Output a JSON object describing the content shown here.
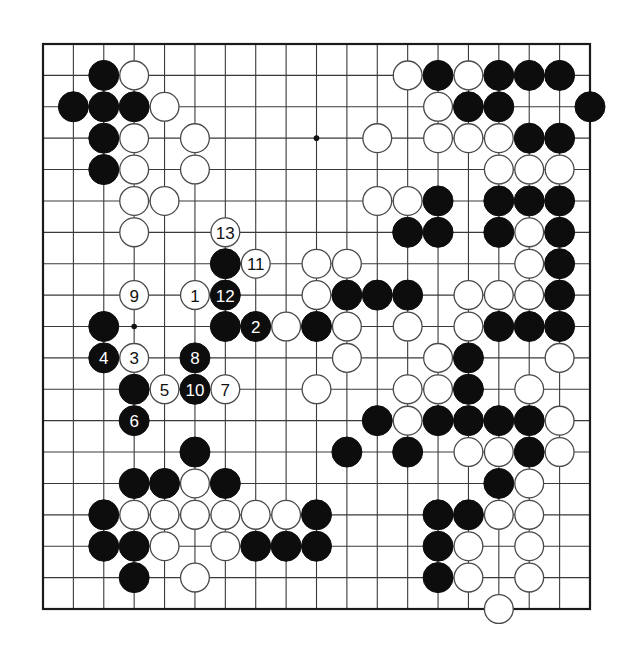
{
  "diagram": {
    "type": "go-board",
    "board_size": 19,
    "layout": {
      "left": 43,
      "top": 44,
      "right": 590,
      "bottom": 609,
      "stone_radius": 15
    },
    "colors": {
      "background": "#ffffff",
      "black": "#0d0d0d",
      "white": "#ffffff",
      "line": "#3a3a3a"
    },
    "star_points": [
      [
        9,
        3
      ],
      [
        3,
        9
      ]
    ],
    "stones": {
      "black": [
        [
          2,
          1
        ],
        [
          13,
          1
        ],
        [
          15,
          1
        ],
        [
          16,
          1
        ],
        [
          17,
          1
        ],
        [
          1,
          2
        ],
        [
          2,
          2
        ],
        [
          3,
          2
        ],
        [
          14,
          2
        ],
        [
          15,
          2
        ],
        [
          18,
          2
        ],
        [
          2,
          3
        ],
        [
          16,
          3
        ],
        [
          17,
          3
        ],
        [
          2,
          4
        ],
        [
          13,
          5
        ],
        [
          15,
          5
        ],
        [
          16,
          5
        ],
        [
          17,
          5
        ],
        [
          12,
          6
        ],
        [
          13,
          6
        ],
        [
          15,
          6
        ],
        [
          17,
          6
        ],
        [
          6,
          7
        ],
        [
          17,
          7
        ],
        [
          10,
          8
        ],
        [
          11,
          8
        ],
        [
          12,
          8
        ],
        [
          17,
          8
        ],
        [
          2,
          9
        ],
        [
          6,
          9
        ],
        [
          9,
          9
        ],
        [
          15,
          9
        ],
        [
          16,
          9
        ],
        [
          17,
          9
        ],
        [
          14,
          10
        ],
        [
          3,
          11
        ],
        [
          14,
          11
        ],
        [
          11,
          12
        ],
        [
          13,
          12
        ],
        [
          14,
          12
        ],
        [
          15,
          12
        ],
        [
          16,
          12
        ],
        [
          5,
          13
        ],
        [
          10,
          13
        ],
        [
          12,
          13
        ],
        [
          16,
          13
        ],
        [
          3,
          14
        ],
        [
          4,
          14
        ],
        [
          6,
          14
        ],
        [
          15,
          14
        ],
        [
          2,
          15
        ],
        [
          9,
          15
        ],
        [
          13,
          15
        ],
        [
          14,
          15
        ],
        [
          2,
          16
        ],
        [
          3,
          16
        ],
        [
          7,
          16
        ],
        [
          8,
          16
        ],
        [
          9,
          16
        ],
        [
          13,
          16
        ],
        [
          3,
          17
        ],
        [
          13,
          17
        ]
      ],
      "white": [
        [
          3,
          1
        ],
        [
          12,
          1
        ],
        [
          14,
          1
        ],
        [
          4,
          2
        ],
        [
          13,
          2
        ],
        [
          3,
          3
        ],
        [
          5,
          3
        ],
        [
          11,
          3
        ],
        [
          13,
          3
        ],
        [
          14,
          3
        ],
        [
          15,
          3
        ],
        [
          3,
          4
        ],
        [
          5,
          4
        ],
        [
          15,
          4
        ],
        [
          16,
          4
        ],
        [
          17,
          4
        ],
        [
          3,
          5
        ],
        [
          4,
          5
        ],
        [
          11,
          5
        ],
        [
          12,
          5
        ],
        [
          3,
          6
        ],
        [
          16,
          6
        ],
        [
          9,
          7
        ],
        [
          10,
          7
        ],
        [
          16,
          7
        ],
        [
          9,
          8
        ],
        [
          14,
          8
        ],
        [
          15,
          8
        ],
        [
          16,
          8
        ],
        [
          8,
          9
        ],
        [
          10,
          9
        ],
        [
          12,
          9
        ],
        [
          14,
          9
        ],
        [
          10,
          10
        ],
        [
          13,
          10
        ],
        [
          17,
          10
        ],
        [
          9,
          11
        ],
        [
          12,
          11
        ],
        [
          13,
          11
        ],
        [
          16,
          11
        ],
        [
          12,
          12
        ],
        [
          17,
          12
        ],
        [
          14,
          13
        ],
        [
          15,
          13
        ],
        [
          17,
          13
        ],
        [
          5,
          14
        ],
        [
          16,
          14
        ],
        [
          3,
          15
        ],
        [
          4,
          15
        ],
        [
          5,
          15
        ],
        [
          6,
          15
        ],
        [
          7,
          15
        ],
        [
          8,
          15
        ],
        [
          15,
          15
        ],
        [
          16,
          15
        ],
        [
          4,
          16
        ],
        [
          6,
          16
        ],
        [
          14,
          16
        ],
        [
          16,
          16
        ],
        [
          5,
          17
        ],
        [
          14,
          17
        ],
        [
          16,
          17
        ],
        [
          15,
          18
        ]
      ]
    },
    "numbered_moves": [
      {
        "n": "1",
        "color": "white",
        "col": 5,
        "row": 8
      },
      {
        "n": "2",
        "color": "black",
        "col": 7,
        "row": 9
      },
      {
        "n": "3",
        "color": "white",
        "col": 3,
        "row": 10
      },
      {
        "n": "4",
        "color": "black",
        "col": 2,
        "row": 10
      },
      {
        "n": "5",
        "color": "white",
        "col": 4,
        "row": 11
      },
      {
        "n": "6",
        "color": "black",
        "col": 3,
        "row": 12
      },
      {
        "n": "7",
        "color": "white",
        "col": 6,
        "row": 11
      },
      {
        "n": "8",
        "color": "black",
        "col": 5,
        "row": 10
      },
      {
        "n": "9",
        "color": "white",
        "col": 3,
        "row": 8
      },
      {
        "n": "10",
        "color": "black",
        "col": 5,
        "row": 11
      },
      {
        "n": "11",
        "color": "white",
        "col": 7,
        "row": 7
      },
      {
        "n": "12",
        "color": "black",
        "col": 6,
        "row": 8
      },
      {
        "n": "13",
        "color": "white",
        "col": 6,
        "row": 6
      }
    ]
  }
}
